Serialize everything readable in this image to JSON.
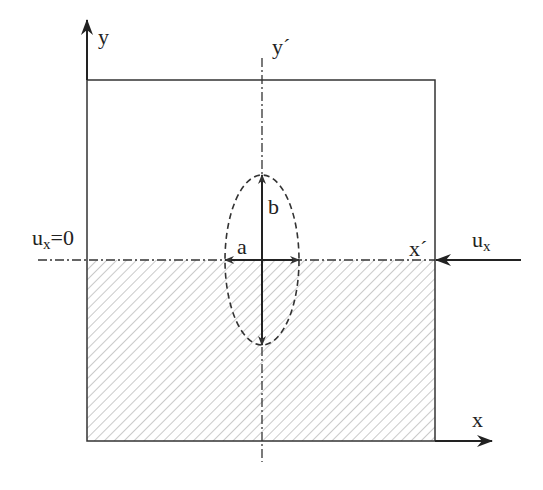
{
  "diagram": {
    "labels": {
      "y_axis": "y",
      "y_prime": "y´",
      "x_axis": "x",
      "x_prime": "x´",
      "a": "a",
      "b": "b",
      "ux_zero_base": "u",
      "ux_zero_sub": "x",
      "ux_zero_rhs": "=0",
      "ux_base": "u",
      "ux_sub": "x"
    },
    "colors": {
      "stroke": "#333333",
      "hatch": "#bdbdbd",
      "background": "#ffffff"
    },
    "geometry": {
      "plate": {
        "left": 87,
        "top": 80,
        "right": 435,
        "bottom": 441
      },
      "ellipse": {
        "cx": 262,
        "cy": 260,
        "rx": 37,
        "ry": 85
      },
      "hatched_region": "lower half of plate (below x´ axis)"
    }
  }
}
